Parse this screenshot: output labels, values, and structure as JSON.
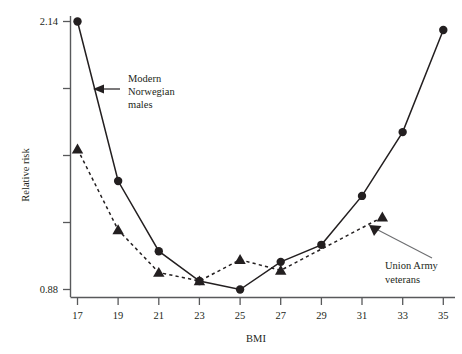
{
  "chart_data": {
    "type": "line",
    "title": "",
    "xlabel": "BMI",
    "ylabel": "Relative risk",
    "xlim": [
      16,
      36
    ],
    "ylim": [
      0.88,
      2.14
    ],
    "grid": false,
    "legend_position": "inline-annotations",
    "x_ticks": [
      17,
      19,
      21,
      23,
      25,
      27,
      29,
      31,
      33,
      35
    ],
    "x_tick_labels": [
      "17",
      "19",
      "21",
      "23",
      "25",
      "27",
      "29",
      "31",
      "33",
      "35"
    ],
    "y_ticks": [
      0.88,
      1.195,
      1.51,
      1.825,
      2.14
    ],
    "y_tick_labels": [
      "0.88",
      "",
      "",
      "",
      "2.14"
    ],
    "y_labeled_min": "0.88",
    "y_labeled_max": "2.14",
    "series": [
      {
        "name": "Modern Norwegian males",
        "marker": "circle",
        "linestyle": "solid",
        "color": "#231f20",
        "x": [
          17,
          19,
          21,
          23,
          25,
          27,
          29,
          31,
          33,
          35
        ],
        "values": [
          2.14,
          1.39,
          1.06,
          0.92,
          0.88,
          1.01,
          1.09,
          1.32,
          1.62,
          2.1
        ]
      },
      {
        "name": "Union Army veterans",
        "marker": "triangle",
        "linestyle": "dashed",
        "color": "#231f20",
        "x": [
          17,
          19,
          21,
          23,
          25,
          27,
          32
        ],
        "values": [
          1.54,
          1.16,
          0.96,
          0.92,
          1.02,
          0.97,
          1.22
        ]
      }
    ],
    "annotations": [
      {
        "id": "modern-norwegian-males",
        "lines": [
          "Modern",
          "Norwegian",
          "males"
        ],
        "text": "Modern Norwegian males",
        "arrow": "left",
        "points_to_series": "Modern Norwegian males"
      },
      {
        "id": "union-army-veterans",
        "lines": [
          "Union Army",
          "veterans"
        ],
        "text": "Union Army veterans",
        "arrow": "up-left",
        "points_to_series": "Union Army veterans"
      }
    ]
  },
  "axes": {
    "x_title": "BMI",
    "y_title": "Relative risk"
  },
  "colors": {
    "ink": "#231f20",
    "axis": "#58595b",
    "leader": "#6d6e71",
    "background": "#ffffff"
  }
}
